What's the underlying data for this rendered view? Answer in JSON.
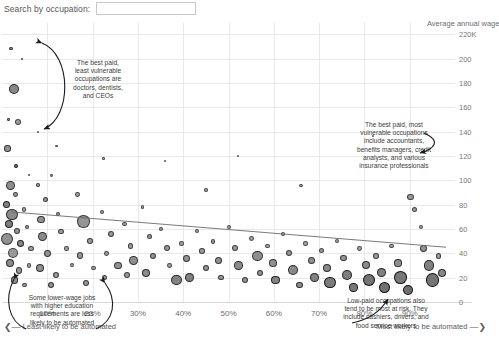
{
  "search": {
    "label": "Search by occupation:",
    "value": "",
    "placeholder": ""
  },
  "chart_data": {
    "type": "scatter",
    "title": "",
    "xlabel": "Share of tasks likely to be automated",
    "ylabel": "Average annual wage",
    "ylabel_display": "Average annual wage",
    "xlim": [
      0,
      100
    ],
    "ylim": [
      0,
      230
    ],
    "grid": true,
    "legend": "none",
    "size_encoding": "bubble area = number of workers employed in occupation",
    "color_encoding": "grayscale fill, darker = denser overlap",
    "x_ticks": [
      10,
      20,
      30,
      40,
      50,
      60,
      70,
      80,
      90
    ],
    "x_tick_labels": [
      "10%",
      "20%",
      "30%",
      "40%",
      "50%",
      "60%",
      "70%",
      "80%",
      "90%"
    ],
    "y_ticks": [
      0,
      20,
      40,
      60,
      80,
      100,
      120,
      140,
      160,
      180,
      200,
      220
    ],
    "y_tick_labels": [
      "0",
      "20",
      "40",
      "60",
      "80",
      "100",
      "120",
      "140",
      "160",
      "180",
      "200",
      "220K"
    ],
    "x_axis_left_note": "Least likely to be automated",
    "x_axis_right_note": "Most likely to be automated",
    "trendline": {
      "x0": 2,
      "y0": 74,
      "x1": 98,
      "y1": 45,
      "visible": true
    },
    "points": [
      {
        "x": 2.0,
        "y": 208,
        "r": 1.6,
        "f": 0.45
      },
      {
        "x": 4.4,
        "y": 200,
        "r": 1.0,
        "f": 0.4
      },
      {
        "x": 2.6,
        "y": 175,
        "r": 5.2,
        "f": 0.52
      },
      {
        "x": 3.6,
        "y": 148,
        "r": 3.0,
        "f": 0.38
      },
      {
        "x": 3.2,
        "y": 112,
        "r": 2.0,
        "f": 0.6
      },
      {
        "x": 6.0,
        "y": 104,
        "r": 1.0,
        "f": 0.35
      },
      {
        "x": 1.4,
        "y": 150,
        "r": 1.2,
        "f": 0.4
      },
      {
        "x": 1.2,
        "y": 126,
        "r": 3.2,
        "f": 0.45
      },
      {
        "x": 1.8,
        "y": 96,
        "r": 4.4,
        "f": 0.48
      },
      {
        "x": 3.0,
        "y": 88,
        "r": 2.4,
        "f": 0.42
      },
      {
        "x": 1.0,
        "y": 80,
        "r": 3.8,
        "f": 0.55
      },
      {
        "x": 2.2,
        "y": 72,
        "r": 5.6,
        "f": 0.5
      },
      {
        "x": 4.8,
        "y": 76,
        "r": 2.2,
        "f": 0.36
      },
      {
        "x": 1.6,
        "y": 64,
        "r": 4.2,
        "f": 0.58
      },
      {
        "x": 3.4,
        "y": 58,
        "r": 3.0,
        "f": 0.44
      },
      {
        "x": 5.6,
        "y": 62,
        "r": 2.0,
        "f": 0.4
      },
      {
        "x": 1.2,
        "y": 52,
        "r": 6.0,
        "f": 0.46
      },
      {
        "x": 4.0,
        "y": 48,
        "r": 3.4,
        "f": 0.52
      },
      {
        "x": 2.4,
        "y": 40,
        "r": 5.0,
        "f": 0.42
      },
      {
        "x": 6.4,
        "y": 44,
        "r": 2.6,
        "f": 0.38
      },
      {
        "x": 1.8,
        "y": 32,
        "r": 4.0,
        "f": 0.5
      },
      {
        "x": 3.8,
        "y": 26,
        "r": 3.2,
        "f": 0.44
      },
      {
        "x": 6.0,
        "y": 30,
        "r": 2.2,
        "f": 0.36
      },
      {
        "x": 2.8,
        "y": 18,
        "r": 3.8,
        "f": 0.48
      },
      {
        "x": 5.0,
        "y": 14,
        "r": 2.4,
        "f": 0.4
      },
      {
        "x": 8.0,
        "y": 96,
        "r": 1.8,
        "f": 0.38
      },
      {
        "x": 9.6,
        "y": 84,
        "r": 2.6,
        "f": 0.42
      },
      {
        "x": 11.0,
        "y": 104,
        "r": 1.4,
        "f": 0.34
      },
      {
        "x": 8.6,
        "y": 68,
        "r": 3.6,
        "f": 0.46
      },
      {
        "x": 12.4,
        "y": 72,
        "r": 2.0,
        "f": 0.38
      },
      {
        "x": 9.0,
        "y": 54,
        "r": 4.6,
        "f": 0.5
      },
      {
        "x": 13.0,
        "y": 58,
        "r": 2.8,
        "f": 0.4
      },
      {
        "x": 10.0,
        "y": 40,
        "r": 3.4,
        "f": 0.44
      },
      {
        "x": 14.2,
        "y": 44,
        "r": 2.2,
        "f": 0.36
      },
      {
        "x": 8.4,
        "y": 28,
        "r": 4.0,
        "f": 0.48
      },
      {
        "x": 12.0,
        "y": 22,
        "r": 3.0,
        "f": 0.42
      },
      {
        "x": 15.5,
        "y": 30,
        "r": 2.0,
        "f": 0.35
      },
      {
        "x": 10.8,
        "y": 14,
        "r": 3.2,
        "f": 0.46
      },
      {
        "x": 16.6,
        "y": 88,
        "r": 2.4,
        "f": 0.38
      },
      {
        "x": 18.0,
        "y": 66,
        "r": 6.2,
        "f": 0.44
      },
      {
        "x": 19.4,
        "y": 50,
        "r": 2.8,
        "f": 0.4
      },
      {
        "x": 17.2,
        "y": 38,
        "r": 3.4,
        "f": 0.42
      },
      {
        "x": 20.2,
        "y": 28,
        "r": 2.4,
        "f": 0.36
      },
      {
        "x": 18.6,
        "y": 16,
        "r": 3.0,
        "f": 0.44
      },
      {
        "x": 22.0,
        "y": 74,
        "r": 2.0,
        "f": 0.36
      },
      {
        "x": 24.0,
        "y": 56,
        "r": 3.2,
        "f": 0.42
      },
      {
        "x": 23.0,
        "y": 40,
        "r": 2.4,
        "f": 0.38
      },
      {
        "x": 25.6,
        "y": 30,
        "r": 3.6,
        "f": 0.46
      },
      {
        "x": 22.6,
        "y": 20,
        "r": 2.6,
        "f": 0.4
      },
      {
        "x": 27.0,
        "y": 64,
        "r": 2.2,
        "f": 0.36
      },
      {
        "x": 28.4,
        "y": 46,
        "r": 2.8,
        "f": 0.4
      },
      {
        "x": 29.0,
        "y": 34,
        "r": 4.4,
        "f": 0.48
      },
      {
        "x": 27.6,
        "y": 22,
        "r": 3.0,
        "f": 0.42
      },
      {
        "x": 31.0,
        "y": 78,
        "r": 1.8,
        "f": 0.34
      },
      {
        "x": 32.6,
        "y": 54,
        "r": 2.6,
        "f": 0.4
      },
      {
        "x": 33.4,
        "y": 38,
        "r": 3.2,
        "f": 0.44
      },
      {
        "x": 31.8,
        "y": 24,
        "r": 4.0,
        "f": 0.5
      },
      {
        "x": 35.0,
        "y": 60,
        "r": 2.0,
        "f": 0.36
      },
      {
        "x": 36.4,
        "y": 44,
        "r": 3.0,
        "f": 0.42
      },
      {
        "x": 37.0,
        "y": 30,
        "r": 2.4,
        "f": 0.38
      },
      {
        "x": 38.6,
        "y": 18,
        "r": 5.4,
        "f": 0.55
      },
      {
        "x": 39.6,
        "y": 48,
        "r": 2.2,
        "f": 0.36
      },
      {
        "x": 40.8,
        "y": 36,
        "r": 3.4,
        "f": 0.44
      },
      {
        "x": 41.4,
        "y": 20,
        "r": 4.6,
        "f": 0.56
      },
      {
        "x": 43.0,
        "y": 58,
        "r": 2.0,
        "f": 0.34
      },
      {
        "x": 44.2,
        "y": 42,
        "r": 2.8,
        "f": 0.4
      },
      {
        "x": 45.0,
        "y": 28,
        "r": 3.2,
        "f": 0.44
      },
      {
        "x": 46.6,
        "y": 50,
        "r": 2.4,
        "f": 0.38
      },
      {
        "x": 47.8,
        "y": 34,
        "r": 3.6,
        "f": 0.46
      },
      {
        "x": 48.4,
        "y": 20,
        "r": 2.8,
        "f": 0.42
      },
      {
        "x": 50.0,
        "y": 62,
        "r": 2.0,
        "f": 0.34
      },
      {
        "x": 51.4,
        "y": 44,
        "r": 3.0,
        "f": 0.4
      },
      {
        "x": 52.2,
        "y": 30,
        "r": 4.2,
        "f": 0.5
      },
      {
        "x": 53.6,
        "y": 18,
        "r": 3.0,
        "f": 0.44
      },
      {
        "x": 55.0,
        "y": 52,
        "r": 2.4,
        "f": 0.36
      },
      {
        "x": 56.4,
        "y": 38,
        "r": 5.2,
        "f": 0.48
      },
      {
        "x": 57.0,
        "y": 24,
        "r": 3.2,
        "f": 0.44
      },
      {
        "x": 58.6,
        "y": 46,
        "r": 2.2,
        "f": 0.36
      },
      {
        "x": 59.8,
        "y": 32,
        "r": 3.8,
        "f": 0.46
      },
      {
        "x": 60.4,
        "y": 18,
        "r": 4.4,
        "f": 0.54
      },
      {
        "x": 62.0,
        "y": 56,
        "r": 2.0,
        "f": 0.34
      },
      {
        "x": 63.4,
        "y": 40,
        "r": 3.0,
        "f": 0.42
      },
      {
        "x": 64.2,
        "y": 26,
        "r": 5.0,
        "f": 0.52
      },
      {
        "x": 65.6,
        "y": 14,
        "r": 3.4,
        "f": 0.48
      },
      {
        "x": 67.0,
        "y": 48,
        "r": 2.2,
        "f": 0.36
      },
      {
        "x": 68.4,
        "y": 34,
        "r": 3.6,
        "f": 0.46
      },
      {
        "x": 69.0,
        "y": 20,
        "r": 4.8,
        "f": 0.56
      },
      {
        "x": 70.6,
        "y": 42,
        "r": 2.6,
        "f": 0.38
      },
      {
        "x": 71.8,
        "y": 28,
        "r": 4.0,
        "f": 0.5
      },
      {
        "x": 72.4,
        "y": 16,
        "r": 5.6,
        "f": 0.6
      },
      {
        "x": 74.0,
        "y": 50,
        "r": 2.0,
        "f": 0.34
      },
      {
        "x": 75.4,
        "y": 36,
        "r": 3.2,
        "f": 0.44
      },
      {
        "x": 76.2,
        "y": 22,
        "r": 5.2,
        "f": 0.58
      },
      {
        "x": 77.6,
        "y": 12,
        "r": 4.2,
        "f": 0.62
      },
      {
        "x": 79.0,
        "y": 44,
        "r": 2.4,
        "f": 0.36
      },
      {
        "x": 80.4,
        "y": 30,
        "r": 4.0,
        "f": 0.5
      },
      {
        "x": 81.0,
        "y": 18,
        "r": 6.0,
        "f": 0.64
      },
      {
        "x": 82.6,
        "y": 38,
        "r": 2.8,
        "f": 0.4
      },
      {
        "x": 83.8,
        "y": 24,
        "r": 4.6,
        "f": 0.56
      },
      {
        "x": 84.4,
        "y": 12,
        "r": 5.4,
        "f": 0.66
      },
      {
        "x": 86.0,
        "y": 46,
        "r": 2.2,
        "f": 0.36
      },
      {
        "x": 87.4,
        "y": 32,
        "r": 3.6,
        "f": 0.48
      },
      {
        "x": 88.0,
        "y": 20,
        "r": 6.4,
        "f": 0.62
      },
      {
        "x": 89.6,
        "y": 10,
        "r": 5.0,
        "f": 0.68
      },
      {
        "x": 91.0,
        "y": 76,
        "r": 2.6,
        "f": 0.38
      },
      {
        "x": 92.4,
        "y": 62,
        "r": 2.0,
        "f": 0.34
      },
      {
        "x": 93.0,
        "y": 44,
        "r": 3.4,
        "f": 0.44
      },
      {
        "x": 94.2,
        "y": 30,
        "r": 5.2,
        "f": 0.56
      },
      {
        "x": 95.0,
        "y": 18,
        "r": 6.6,
        "f": 0.64
      },
      {
        "x": 96.4,
        "y": 38,
        "r": 2.8,
        "f": 0.4
      },
      {
        "x": 97.2,
        "y": 24,
        "r": 4.0,
        "f": 0.52
      },
      {
        "x": 90.2,
        "y": 86,
        "r": 3.2,
        "f": 0.4
      },
      {
        "x": 36.0,
        "y": 116,
        "r": 1.2,
        "f": 0.3
      },
      {
        "x": 52.0,
        "y": 120,
        "r": 1.0,
        "f": 0.3
      },
      {
        "x": 82.0,
        "y": 136,
        "r": 1.0,
        "f": 0.3
      },
      {
        "x": 22.4,
        "y": 118,
        "r": 1.2,
        "f": 0.32
      },
      {
        "x": 66.0,
        "y": 96,
        "r": 1.6,
        "f": 0.32
      },
      {
        "x": 45.0,
        "y": 92,
        "r": 1.8,
        "f": 0.34
      },
      {
        "x": 12.0,
        "y": 128,
        "r": 1.2,
        "f": 0.32
      },
      {
        "x": 8.0,
        "y": 140,
        "r": 1.0,
        "f": 0.3
      }
    ]
  },
  "annotations": [
    {
      "id": "anno-1",
      "text": "The best paid,\nleast vulnerable\noccupations are\ndoctors, dentists,\nand CEOs"
    },
    {
      "id": "anno-2",
      "text": "The best paid, most\nvulnerable occupations\ninclude accountants,\nbenefits managers, credit\nanalysts, and various\ninsurance professionals"
    },
    {
      "id": "anno-3",
      "text": "Some lower-wage jobs\nwith higher education\nrequirements are less\nlikely to be automated"
    },
    {
      "id": "anno-4",
      "text": "Low-paid occupations also\ntend to be most at risk. They\ninclude cashiers, drivers, and\nfood service workers"
    }
  ],
  "colors": {
    "background": "#ffffff",
    "grid": "#e9e9e9",
    "text": "#4a4a4a",
    "tick_text": "#6d6d6d",
    "bubble": "#808080",
    "trendline": "#6b6b6b"
  }
}
